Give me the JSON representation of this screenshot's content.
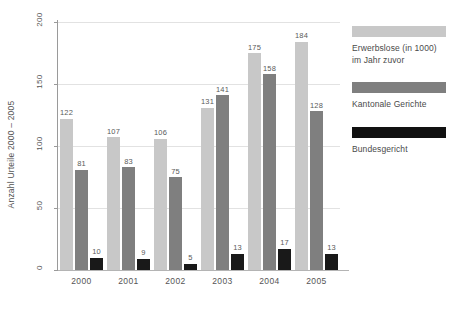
{
  "chart_data": {
    "type": "bar",
    "title": "",
    "xlabel": "",
    "ylabel": "Anzahl Urteile 2000 – 2005",
    "categories": [
      "2000",
      "2001",
      "2002",
      "2003",
      "2004",
      "2005"
    ],
    "ylim": [
      0,
      200
    ],
    "yticks": [
      0,
      50,
      100,
      150,
      200
    ],
    "ytick_labels": [
      "0",
      "50",
      "100",
      "150",
      "200"
    ],
    "grid": true,
    "legend_position": "right",
    "series": [
      {
        "name": "Erwerbslose (in 1000) im Jahr zuvor",
        "color": "#c8c8c8",
        "values": [
          122,
          107,
          106,
          131,
          175,
          184
        ]
      },
      {
        "name": "Kantonale Gerichte",
        "color": "#7f7f7f",
        "values": [
          81,
          83,
          75,
          141,
          158,
          128
        ]
      },
      {
        "name": "Bundesgericht",
        "color": "#191919",
        "values": [
          10,
          9,
          5,
          13,
          17,
          13
        ]
      }
    ]
  },
  "legend": {
    "entries": [
      {
        "label_line1": "Erwerbslose (in 1000)",
        "label_line2": "im Jahr zuvor",
        "swatch": "light-gray"
      },
      {
        "label_line1": "Kantonale Gerichte",
        "label_line2": "",
        "swatch": "medium-gray"
      },
      {
        "label_line1": "Bundesgericht",
        "label_line2": "",
        "swatch": "black"
      }
    ]
  }
}
